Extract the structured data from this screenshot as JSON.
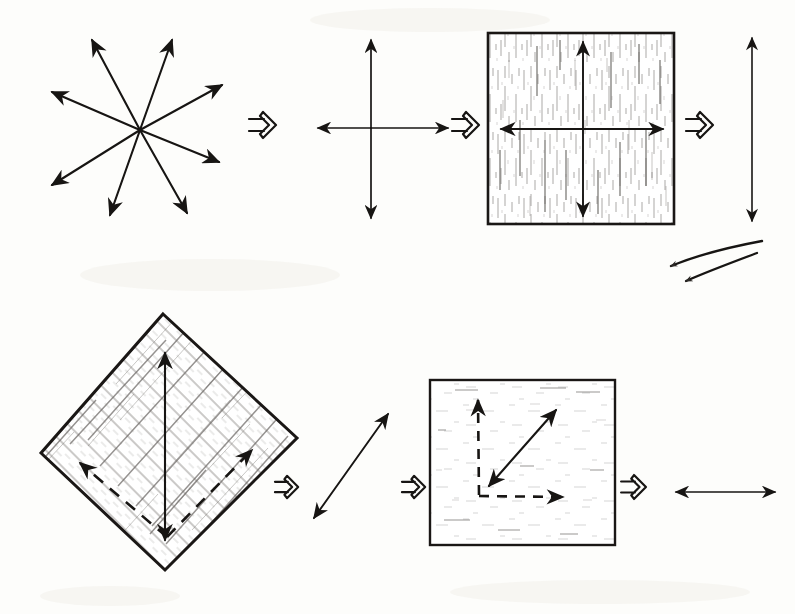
{
  "figure": {
    "background_color": "#fdfdfb",
    "ink_color": "#171513",
    "hatch_color": "#6d6a66",
    "width": 795,
    "height": 614,
    "rows": [
      {
        "row_id": "top-row",
        "label": "Top row: eight-fold star reduced to a single vertical double arrow",
        "steps": [
          {
            "step_id": "star-of-arrows",
            "kind": "arrow-star",
            "caption": "Eight-fold star of double-headed arrows",
            "center": [
              140,
              130
            ],
            "tips": [
              [
                92,
                40
              ],
              [
                172,
                40
              ],
              [
                222,
                85
              ],
              [
                219,
                162
              ],
              [
                187,
                213
              ],
              [
                110,
                215
              ],
              [
                52,
                185
              ],
              [
                52,
                92
              ]
            ],
            "arrow_count": 8
          },
          {
            "step_id": "implies-1",
            "kind": "implies-glyph",
            "glyph": "double-right-arrow",
            "position": [
              263,
              125
            ]
          },
          {
            "step_id": "cross-axes",
            "kind": "cross",
            "caption": "Four-fold cross of double arrows",
            "center": [
              371,
              128
            ],
            "vertical_extent": [
              40,
              218
            ],
            "horizontal_extent": [
              318,
              448
            ]
          },
          {
            "step_id": "implies-2",
            "kind": "implies-glyph",
            "glyph": "double-right-arrow",
            "position": [
              466,
              125
            ]
          },
          {
            "step_id": "boxed-cross",
            "kind": "boxed-cross",
            "caption": "Cross inside a square crystal boundary",
            "box": [
              488,
              33,
              186,
              191
            ],
            "center": [
              583,
              129
            ],
            "texture": "vertical-speckle"
          },
          {
            "step_id": "implies-3",
            "kind": "implies-glyph",
            "glyph": "double-right-arrow",
            "position": [
              700,
              125
            ]
          },
          {
            "step_id": "vertical-double-arrow",
            "kind": "double-arrow",
            "caption": "Single vertical double-headed arrow",
            "from": [
              752,
              221
            ],
            "to": [
              752,
              38
            ]
          }
        ]
      },
      {
        "row_id": "wrap-arrow",
        "label": "Curved arrow wrapping to the second row",
        "steps": [
          {
            "step_id": "wrap-curved-arrow",
            "kind": "curved-arrow",
            "caption": "Curved continuation arrow pointing left",
            "from": [
              760,
              243
            ],
            "to": [
              668,
              268
            ]
          }
        ]
      },
      {
        "row_id": "bottom-row",
        "label": "Bottom row: rotated diamond reduced to a horizontal double arrow",
        "steps": [
          {
            "step_id": "hatched-diamond",
            "kind": "hatched-diamond",
            "caption": "Rotated (45 degree) hatched square with solid vertical and dashed diagonal arrows",
            "corners": [
              [
                163,
                314
              ],
              [
                297,
                438
              ],
              [
                165,
                570
              ],
              [
                41,
                453
              ]
            ],
            "solid_arrow": {
              "from": [
                165,
                535
              ],
              "to": [
                165,
                355
              ]
            },
            "dashed_arrow_left": {
              "from": [
                165,
                535
              ],
              "to": [
                78,
                462
              ]
            },
            "dashed_arrow_right": {
              "from": [
                165,
                535
              ],
              "to": [
                253,
                450
              ]
            },
            "texture": "diagonal-hatch"
          },
          {
            "step_id": "implies-4",
            "kind": "implies-glyph",
            "glyph": "double-right-arrow",
            "position": [
              287,
              487
            ]
          },
          {
            "step_id": "diagonal-double-arrow",
            "kind": "double-arrow",
            "caption": "Single diagonal double-headed arrow",
            "from": [
              314,
              518
            ],
            "to": [
              388,
              414
            ]
          },
          {
            "step_id": "implies-5",
            "kind": "implies-glyph",
            "glyph": "double-right-arrow",
            "position": [
              414,
              487
            ]
          },
          {
            "step_id": "boxed-diagonal",
            "kind": "boxed-diagonal",
            "caption": "Square with dashed axis arrows and a solid diagonal double arrow",
            "box": [
              430,
              380,
              185,
              165
            ],
            "origin": [
              480,
              495
            ],
            "dashed_vertical_tip": [
              478,
              400
            ],
            "dashed_horizontal_tip": [
              563,
              497
            ],
            "solid_diagonal_from": [
              489,
              486
            ],
            "solid_diagonal_to": [
              556,
              410
            ],
            "texture": "light-speckle"
          },
          {
            "step_id": "implies-6",
            "kind": "implies-glyph",
            "glyph": "double-right-arrow",
            "position": [
              634,
              487
            ]
          },
          {
            "step_id": "horizontal-double-arrow",
            "kind": "double-arrow",
            "caption": "Single horizontal double-headed arrow",
            "from": [
              676,
              492
            ],
            "to": [
              775,
              492
            ]
          }
        ]
      }
    ]
  }
}
